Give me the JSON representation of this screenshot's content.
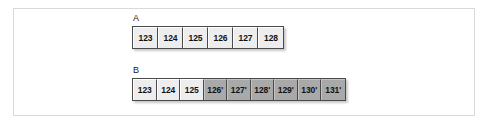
{
  "figure": {
    "background_color": "#ffffff",
    "frame_border_color": "#d9d9d9",
    "cell_border_color": "#4a4a4a",
    "shade_light_color": "#ededed",
    "shade_dark_color": "#a9a9a9",
    "rows": [
      {
        "id": "a",
        "label": "A",
        "cells": [
          {
            "text": "123",
            "shade": "light"
          },
          {
            "text": "124",
            "shade": "light"
          },
          {
            "text": "125",
            "shade": "light"
          },
          {
            "text": "126",
            "shade": "light"
          },
          {
            "text": "127",
            "shade": "light"
          },
          {
            "text": "128",
            "shade": "light"
          }
        ]
      },
      {
        "id": "b",
        "label": "B",
        "cells": [
          {
            "text": "123",
            "shade": "light"
          },
          {
            "text": "124",
            "shade": "light"
          },
          {
            "text": "125",
            "shade": "light"
          },
          {
            "text": "126'",
            "shade": "dark"
          },
          {
            "text": "127'",
            "shade": "dark"
          },
          {
            "text": "128'",
            "shade": "dark"
          },
          {
            "text": "129'",
            "shade": "dark"
          },
          {
            "text": "130'",
            "shade": "dark"
          },
          {
            "text": "131'",
            "shade": "dark"
          }
        ]
      }
    ]
  }
}
